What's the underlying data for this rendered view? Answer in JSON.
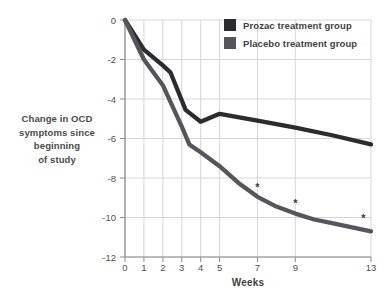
{
  "chart_data": {
    "type": "line",
    "xlabel": "Weeks",
    "ylabel_lines": [
      "Change in OCD",
      "symptoms since",
      "beginning",
      "of study"
    ],
    "xlim": [
      0,
      13
    ],
    "ylim": [
      -12,
      0
    ],
    "x_ticks": [
      0,
      1,
      2,
      3,
      4,
      5,
      7,
      9,
      13
    ],
    "y_ticks": [
      0,
      -2,
      -4,
      -6,
      -8,
      -10,
      -12
    ],
    "grid": true,
    "legend_position": "top-right",
    "series": [
      {
        "name": "Prozac treatment group",
        "color": "#2b2b30",
        "points": [
          [
            0,
            0
          ],
          [
            1,
            -1.5
          ],
          [
            2,
            -2.3
          ],
          [
            2.4,
            -2.65
          ],
          [
            3.2,
            -4.55
          ],
          [
            4,
            -5.15
          ],
          [
            5,
            -4.75
          ],
          [
            7,
            -5.1
          ],
          [
            9,
            -5.45
          ],
          [
            11,
            -5.85
          ],
          [
            13,
            -6.3
          ]
        ]
      },
      {
        "name": "Placebo treatment group",
        "color": "#55565c",
        "points": [
          [
            0,
            0
          ],
          [
            1,
            -2.0
          ],
          [
            2,
            -3.3
          ],
          [
            3,
            -5.4
          ],
          [
            3.4,
            -6.3
          ],
          [
            4,
            -6.7
          ],
          [
            5,
            -7.4
          ],
          [
            6,
            -8.25
          ],
          [
            7,
            -8.95
          ],
          [
            8,
            -9.45
          ],
          [
            9,
            -9.8
          ],
          [
            10,
            -10.1
          ],
          [
            11,
            -10.3
          ],
          [
            12,
            -10.5
          ],
          [
            13,
            -10.7
          ]
        ]
      }
    ],
    "annotations": [
      {
        "text": "*",
        "x": 7,
        "y": -8.45
      },
      {
        "text": "*",
        "x": 9,
        "y": -9.25
      },
      {
        "text": "*",
        "x": 12.6,
        "y": -10.05
      }
    ]
  },
  "colors": {
    "grid": "#d6d6d6",
    "axis": "#8c8c8c",
    "tick_text": "#4f4f4f",
    "annotation": "#3a3a3a"
  }
}
